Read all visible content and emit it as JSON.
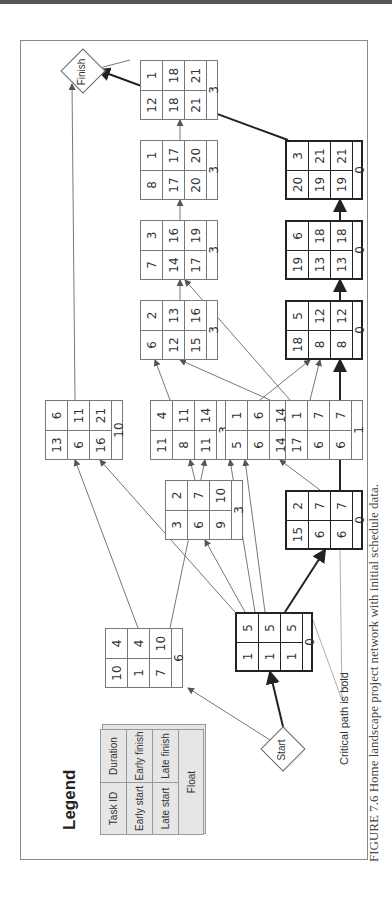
{
  "figure": {
    "caption": "FIGURE 7.6  Home landscape project network with initial schedule data.",
    "critical_note": "Critical path is bold",
    "orientation": "rotated 90° counter-clockwise"
  },
  "nodes": {
    "start": "Start",
    "finish": "Finish"
  },
  "legend": {
    "title": "Legend",
    "cells": {
      "task_id": "Task ID",
      "duration": "Duration",
      "early_start": "Early start",
      "early_finish": "Early finish",
      "late_start": "Late start",
      "late_finish": "Late finish",
      "float": "Float"
    }
  },
  "tasks": [
    {
      "id": "1",
      "dur": "5",
      "es": "1",
      "ef": "5",
      "ls": "1",
      "lf": "5",
      "float": "0",
      "critical": true
    },
    {
      "id": "10",
      "dur": "4",
      "es": "1",
      "ef": "4",
      "ls": "7",
      "lf": "10",
      "float": "6",
      "critical": false
    },
    {
      "id": "3",
      "dur": "2",
      "es": "6",
      "ef": "7",
      "ls": "9",
      "lf": "10",
      "float": "3",
      "critical": false
    },
    {
      "id": "13",
      "dur": "6",
      "es": "6",
      "ef": "11",
      "ls": "16",
      "lf": "21",
      "float": "10",
      "critical": false
    },
    {
      "id": "11",
      "dur": "4",
      "es": "8",
      "ef": "11",
      "ls": "11",
      "lf": "14",
      "float": "3",
      "critical": false
    },
    {
      "id": "5",
      "dur": "1",
      "es": "6",
      "ef": "6",
      "ls": "14",
      "lf": "14",
      "float": "8",
      "critical": false
    },
    {
      "id": "17",
      "dur": "1",
      "es": "6",
      "ef": "7",
      "ls": "6",
      "lf": "7",
      "float": "1",
      "critical": false
    },
    {
      "id": "15",
      "dur": "2",
      "es": "6",
      "ef": "7",
      "ls": "6",
      "lf": "7",
      "float": "0",
      "critical": true
    },
    {
      "id": "6",
      "dur": "2",
      "es": "12",
      "ef": "13",
      "ls": "15",
      "lf": "16",
      "float": "3",
      "critical": false
    },
    {
      "id": "7",
      "dur": "3",
      "es": "14",
      "ef": "16",
      "ls": "17",
      "lf": "19",
      "float": "3",
      "critical": false
    },
    {
      "id": "8",
      "dur": "1",
      "es": "17",
      "ef": "17",
      "ls": "20",
      "lf": "20",
      "float": "3",
      "critical": false
    },
    {
      "id": "12",
      "dur": "1",
      "es": "18",
      "ef": "18",
      "ls": "21",
      "lf": "21",
      "float": "3",
      "critical": false
    },
    {
      "id": "18",
      "dur": "5",
      "es": "8",
      "ef": "12",
      "ls": "8",
      "lf": "12",
      "float": "0",
      "critical": true
    },
    {
      "id": "19",
      "dur": "6",
      "es": "13",
      "ef": "18",
      "ls": "13",
      "lf": "18",
      "float": "0",
      "critical": true
    },
    {
      "id": "20",
      "dur": "3",
      "es": "19",
      "ef": "21",
      "ls": "19",
      "lf": "21",
      "float": "0",
      "critical": true
    }
  ],
  "critical_path": [
    "Start",
    "1",
    "15",
    "18",
    "19",
    "20",
    "Finish"
  ]
}
